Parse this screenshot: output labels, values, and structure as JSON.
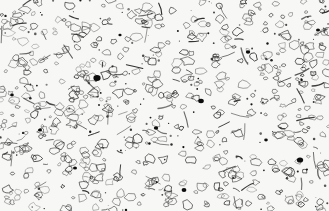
{
  "image": {
    "subject": "metallographic micrograph",
    "description": "grayscale microstructure with scattered grain outlines, elongated particles and dark inclusions on a light background",
    "width": 329,
    "height": 211,
    "colors": {
      "background": "#f7f7f5",
      "outline": "#2a2a2a",
      "inclusion": "#0c0c0c"
    }
  }
}
